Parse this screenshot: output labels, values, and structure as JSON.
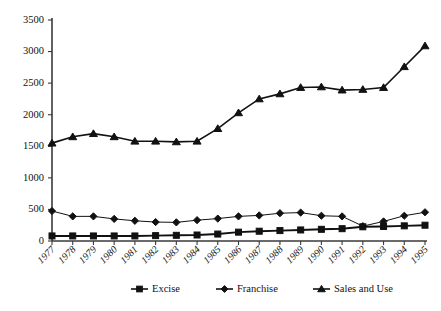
{
  "chart_data": {
    "type": "line",
    "title": "",
    "xlabel": "",
    "ylabel": "",
    "ylim": [
      0,
      3500
    ],
    "ytick_step": 500,
    "yticks": [
      0,
      500,
      1000,
      1500,
      2000,
      2500,
      3000,
      3500
    ],
    "grid": false,
    "legend_position": "bottom",
    "categories": [
      "1977",
      "1978",
      "1979",
      "1980",
      "1981",
      "1982",
      "1983",
      "1984",
      "1985",
      "1986",
      "1987",
      "1988",
      "1989",
      "1990",
      "1991",
      "1992",
      "1993",
      "1994",
      "1995"
    ],
    "series": [
      {
        "name": "Excise",
        "marker": "square",
        "values": [
          80,
          80,
          80,
          80,
          80,
          85,
          90,
          95,
          110,
          140,
          155,
          165,
          175,
          185,
          195,
          225,
          230,
          240,
          250
        ]
      },
      {
        "name": "Franchise",
        "marker": "diamond",
        "values": [
          475,
          390,
          390,
          350,
          320,
          300,
          295,
          330,
          355,
          390,
          405,
          440,
          450,
          400,
          390,
          235,
          310,
          400,
          455
        ]
      },
      {
        "name": "Sales and Use",
        "marker": "triangle",
        "values": [
          1550,
          1650,
          1700,
          1650,
          1580,
          1580,
          1570,
          1580,
          1780,
          2030,
          2250,
          2330,
          2430,
          2440,
          2390,
          2400,
          2430,
          2760,
          3090
        ]
      }
    ]
  },
  "legend": {
    "items": [
      {
        "label": "Excise",
        "marker": "square"
      },
      {
        "label": "Franchise",
        "marker": "diamond"
      },
      {
        "label": "Sales and Use",
        "marker": "triangle"
      }
    ]
  },
  "colors": {
    "series": "#111111",
    "axis": "#3a3a3a",
    "background": "#ffffff"
  }
}
